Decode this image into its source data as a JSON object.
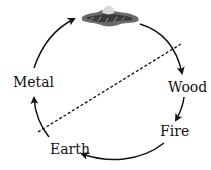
{
  "diagram": {
    "title": "",
    "type": "cycle",
    "nodes": [
      {
        "id": "top",
        "label": "",
        "icon": "water-mountain-illustration"
      },
      {
        "id": "wood",
        "label": "Wood"
      },
      {
        "id": "fire",
        "label": "Fire"
      },
      {
        "id": "earth",
        "label": "Earth"
      },
      {
        "id": "metal",
        "label": "Metal"
      }
    ],
    "edges": [
      {
        "from": "top",
        "to": "wood",
        "style": "solid-arrow"
      },
      {
        "from": "wood",
        "to": "fire",
        "style": "solid-arrow"
      },
      {
        "from": "fire",
        "to": "earth",
        "style": "solid-arrow"
      },
      {
        "from": "earth",
        "to": "metal",
        "style": "solid-arrow"
      },
      {
        "from": "metal",
        "to": "top",
        "style": "solid-arrow"
      }
    ],
    "divider": {
      "style": "dashed",
      "from": [
        38,
        132
      ],
      "to": [
        181,
        44
      ]
    },
    "colors": {
      "line": "#111111",
      "background": "#ffffff"
    }
  }
}
